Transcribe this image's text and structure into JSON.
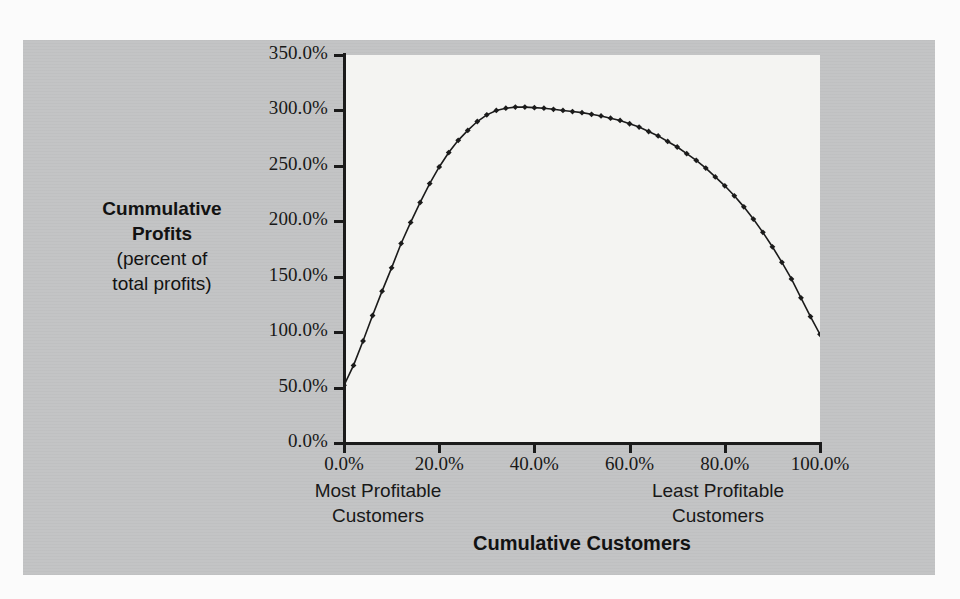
{
  "chart_data": {
    "type": "line",
    "title": "",
    "subtitle": "",
    "xlabel": "Cumulative Customers",
    "ylabel": "Cummulative Profits (percent of total profits)",
    "ylabel_lines": [
      "Cummulative",
      "Profits",
      "(percent of",
      "total profits)"
    ],
    "xlim": [
      0,
      100
    ],
    "ylim": [
      0,
      350
    ],
    "grid": false,
    "legend": null,
    "x_tick_labels": [
      "0.0%",
      "20.0%",
      "40.0%",
      "60.0%",
      "80.0%",
      "100.0%"
    ],
    "x_ticks": [
      0,
      20,
      40,
      60,
      80,
      100
    ],
    "y_tick_labels": [
      "0.0%",
      "50.0%",
      "100.0%",
      "150.0%",
      "200.0%",
      "250.0%",
      "300.0%",
      "350.0%"
    ],
    "y_ticks": [
      0,
      50,
      100,
      150,
      200,
      250,
      300,
      350
    ],
    "annotations": [
      {
        "name": "most-profitable",
        "lines": [
          "Most Profitable",
          "Customers"
        ],
        "x": 10
      },
      {
        "name": "least-profitable",
        "lines": [
          "Least Profitable",
          "Customers"
        ],
        "x": 83
      }
    ],
    "series": [
      {
        "name": "Cumulative profit curve",
        "marker": "diamond",
        "color": "#1b1b1b",
        "x": [
          0,
          2,
          4,
          6,
          8,
          10,
          12,
          14,
          16,
          18,
          20,
          22,
          24,
          26,
          28,
          30,
          32,
          34,
          36,
          38,
          40,
          42,
          44,
          46,
          48,
          50,
          52,
          54,
          56,
          58,
          60,
          62,
          64,
          66,
          68,
          70,
          72,
          74,
          76,
          78,
          80,
          82,
          84,
          86,
          88,
          90,
          92,
          94,
          96,
          98,
          100
        ],
        "values": [
          52,
          70,
          92,
          115,
          137,
          158,
          180,
          199,
          217,
          234,
          249,
          262,
          273,
          282,
          290,
          296,
          300,
          302,
          303,
          303,
          302.5,
          302,
          301,
          300,
          299,
          298,
          296.5,
          295,
          293,
          291,
          288,
          285,
          281,
          277,
          272,
          267,
          261,
          255,
          248,
          240,
          232,
          223,
          213,
          202,
          190,
          177,
          163,
          148,
          131,
          114,
          98
        ]
      }
    ]
  },
  "axis": {
    "y_title_bold": "Cummulative Profits",
    "x_title": "Cumulative Customers"
  }
}
